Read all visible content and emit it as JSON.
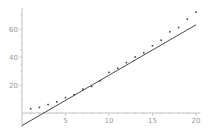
{
  "chart_data": {
    "type": "scatter",
    "title": "",
    "xlabel": "",
    "ylabel": "",
    "xlim": [
      0,
      20.5
    ],
    "ylim": [
      -10,
      75
    ],
    "grid": false,
    "legend": null,
    "x_ticks": [
      5,
      10,
      15,
      20
    ],
    "x_tick_labels": [
      "5",
      "10",
      "15",
      "20"
    ],
    "y_ticks": [
      20,
      40,
      60
    ],
    "y_tick_labels": [
      "20",
      "40",
      "60"
    ],
    "series": [
      {
        "name": "data",
        "kind": "points",
        "x": [
          1,
          2,
          3,
          4,
          5,
          6,
          7,
          8,
          9,
          10,
          11,
          12,
          13,
          14,
          15,
          16,
          17,
          18,
          19,
          20
        ],
        "y": [
          3,
          4,
          6,
          8,
          11,
          13,
          17,
          19,
          23,
          29,
          32,
          36,
          40,
          43,
          48,
          52,
          58,
          61,
          67,
          72
        ]
      },
      {
        "name": "linear fit",
        "kind": "line",
        "x": [
          0,
          20
        ],
        "y": [
          -9,
          63
        ]
      }
    ],
    "colors": {
      "points": "#444444",
      "line": "#333333",
      "axes": "#b0b0b0",
      "labels": "#9a9a9a"
    }
  }
}
